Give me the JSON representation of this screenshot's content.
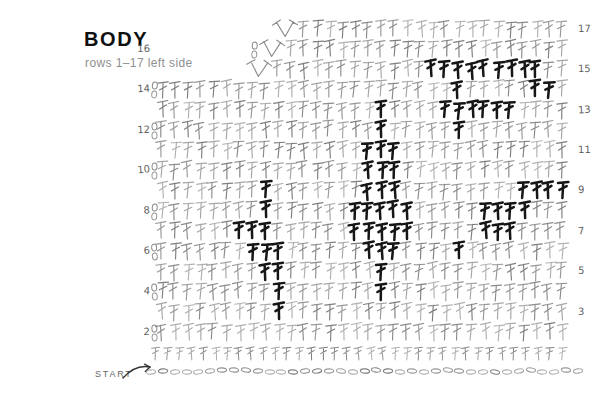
{
  "title": "BODY",
  "subtitle": "rows 1–17 left side",
  "start_label": "START",
  "colors": {
    "background": "#ffffff",
    "stitch_grays": [
      "#8b8b8b",
      "#989898",
      "#a6a6a6",
      "#7e7e7e",
      "#b0b0b0"
    ],
    "bold_stitch": "#161616",
    "row_label": "#5f5f5f",
    "title": "#101010",
    "subtitle": "#8f8f8f",
    "start": "#666666",
    "arrow": "#333333"
  },
  "chart": {
    "type": "crochet-stitch-diagram",
    "stitch_symbol": "double-crochet-T",
    "decrease_symbol": "dc2tog",
    "grid": {
      "x_start": 162,
      "col_spacing": 12.9,
      "row1_baseline_y": 360,
      "row_spacing": 20.2,
      "left_label_x": 134,
      "right_label_x": 578
    },
    "foundation_chain": {
      "symbol": "chain-oval",
      "count": 37,
      "x_start": 151,
      "x_end": 578,
      "y": 371
    },
    "row1": {
      "count": 35,
      "x_start": 156,
      "x_end": 562
    },
    "rows": [
      {
        "num": 2,
        "label_side": "left",
        "start_col": 0,
        "end_col": 31,
        "bold_cols": [],
        "chains_x": 150,
        "decrease_apex_col": null
      },
      {
        "num": 3,
        "label_side": "right",
        "start_col": 0,
        "end_col": 31,
        "bold_cols": [
          9
        ],
        "chains_x": null,
        "decrease_apex_col": null
      },
      {
        "num": 4,
        "label_side": "left",
        "start_col": 0,
        "end_col": 31,
        "bold_cols": [
          9,
          17
        ],
        "chains_x": 150,
        "decrease_apex_col": null
      },
      {
        "num": 5,
        "label_side": "right",
        "start_col": 0,
        "end_col": 31,
        "bold_cols": [
          8,
          9,
          17
        ],
        "chains_x": null,
        "decrease_apex_col": null
      },
      {
        "num": 6,
        "label_side": "left",
        "start_col": 0,
        "end_col": 31,
        "bold_cols": [
          7,
          8,
          9,
          16,
          17,
          18,
          23
        ],
        "chains_x": 150,
        "decrease_apex_col": null
      },
      {
        "num": 7,
        "label_side": "right",
        "start_col": 0,
        "end_col": 31,
        "bold_cols": [
          6,
          7,
          8,
          15,
          16,
          17,
          18,
          19,
          25,
          26,
          27
        ],
        "chains_x": null,
        "decrease_apex_col": null
      },
      {
        "num": 8,
        "label_side": "left",
        "start_col": 0,
        "end_col": 31,
        "bold_cols": [
          8,
          15,
          16,
          17,
          18,
          19,
          25,
          26,
          27,
          28
        ],
        "chains_x": 150,
        "decrease_apex_col": null
      },
      {
        "num": 9,
        "label_side": "right",
        "start_col": 0,
        "end_col": 31,
        "bold_cols": [
          8,
          16,
          17,
          18,
          28,
          29,
          30,
          31
        ],
        "chains_x": null,
        "decrease_apex_col": null
      },
      {
        "num": 10,
        "label_side": "left",
        "start_col": 0,
        "end_col": 31,
        "bold_cols": [
          16,
          17,
          18
        ],
        "chains_x": 150,
        "decrease_apex_col": null
      },
      {
        "num": 11,
        "label_side": "right",
        "start_col": 0,
        "end_col": 31,
        "bold_cols": [
          16,
          17,
          18
        ],
        "chains_x": null,
        "decrease_apex_col": null
      },
      {
        "num": 12,
        "label_side": "left",
        "start_col": 0,
        "end_col": 31,
        "bold_cols": [
          17,
          23
        ],
        "chains_x": 150,
        "decrease_apex_col": null
      },
      {
        "num": 13,
        "label_side": "right",
        "start_col": 0,
        "end_col": 31,
        "bold_cols": [
          17,
          22,
          23,
          24,
          25,
          26,
          27
        ],
        "chains_x": null,
        "decrease_apex_col": null
      },
      {
        "num": 14,
        "label_side": "left",
        "start_col": 0,
        "end_col": 31,
        "bold_cols": [
          23,
          29,
          30
        ],
        "chains_x": 150,
        "decrease_apex_col": null
      },
      {
        "num": 15,
        "label_side": "right",
        "start_col": 9,
        "end_col": 31,
        "bold_cols": [
          21,
          22,
          23,
          24,
          25,
          26,
          27,
          28,
          29
        ],
        "chains_x": null,
        "decrease_apex_col": 7.5
      },
      {
        "num": 16,
        "label_side": "left",
        "start_col": 10,
        "end_col": 31,
        "bold_cols": [],
        "chains_x": 250,
        "decrease_apex_col": 8.5
      },
      {
        "num": 17,
        "label_side": "right",
        "start_col": 11,
        "end_col": 31,
        "bold_cols": [],
        "chains_x": null,
        "decrease_apex_col": 9.5
      }
    ]
  }
}
